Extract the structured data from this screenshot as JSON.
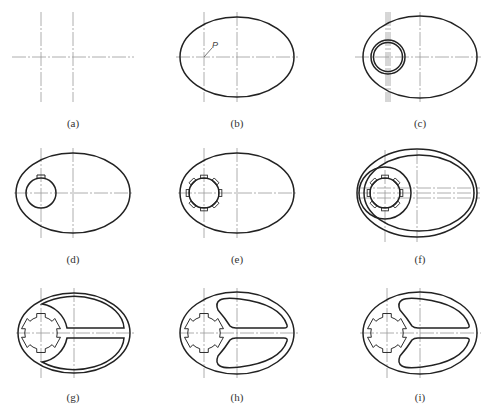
{
  "figure": {
    "caption": "",
    "point_label": "P",
    "panels": [
      {
        "id": "a",
        "label": "(a)",
        "content": "centerlines only"
      },
      {
        "id": "b",
        "label": "(b)",
        "content": "outer ellipse with point P"
      },
      {
        "id": "c",
        "label": "(c)",
        "content": "ellipse with concentric circles"
      },
      {
        "id": "d",
        "label": "(d)",
        "content": "ellipse with circle and one key notch"
      },
      {
        "id": "e",
        "label": "(e)",
        "content": "ellipse with splined circle"
      },
      {
        "id": "f",
        "label": "(f)",
        "content": "double ellipse with spline and boss circle"
      },
      {
        "id": "g",
        "label": "(g)",
        "content": "wrench outline with slot"
      },
      {
        "id": "h",
        "label": "(h)",
        "content": "wrench with two rounded pockets"
      },
      {
        "id": "i",
        "label": "(i)",
        "content": "final wrench outline"
      }
    ]
  },
  "colors": {
    "outline": "#222222",
    "centerline": "#9a9a9a",
    "background": "#ffffff"
  }
}
